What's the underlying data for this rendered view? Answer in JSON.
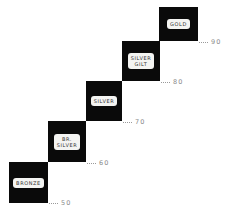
{
  "diagram": {
    "type": "staircase",
    "colors": {
      "step_fill": "#0a0a0a",
      "badge_fill": "#f4f4f2",
      "badge_text": "#333333",
      "leader_text": "#8a8a8a",
      "background": "#ffffff"
    },
    "steps": [
      {
        "label": "BRONZE",
        "threshold": "50"
      },
      {
        "label": "BR.\nSILVER",
        "threshold": "60"
      },
      {
        "label": "SILVER",
        "threshold": "70"
      },
      {
        "label": "SILVER\nGILT",
        "threshold": "80"
      },
      {
        "label": "GOLD",
        "threshold": "90"
      }
    ]
  }
}
